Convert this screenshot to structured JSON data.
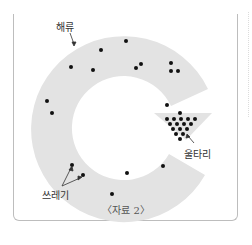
{
  "diagram": {
    "labels": {
      "current": "해류",
      "trash": "쓰레기",
      "fence": "울타리"
    },
    "caption": "〈자료 2〉",
    "colors": {
      "ring": "#e3e3e3",
      "dot": "#111111",
      "frame": "#bdbdbd",
      "text": "#333333"
    }
  }
}
